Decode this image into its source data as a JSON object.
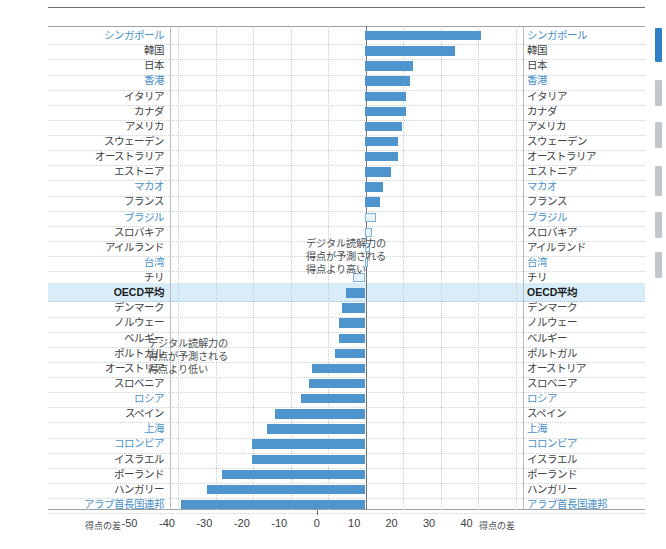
{
  "chart_data": {
    "type": "bar",
    "orientation": "horizontal",
    "title": "",
    "xlabel": "得点の差",
    "ylabel": "",
    "xlim": [
      -52,
      42
    ],
    "xticks": [
      -50,
      -40,
      -30,
      -20,
      -10,
      0,
      10,
      20,
      30,
      40
    ],
    "xtick_labels": [
      "-50",
      "-40",
      "-30",
      "-20",
      "-10",
      "0",
      "10",
      "20",
      "30",
      "40"
    ],
    "axis_caption_left": "得点の差",
    "axis_caption_right": "得点の差",
    "grid": true,
    "legend": "none",
    "annotations": [
      {
        "name": "higher-than-expected",
        "lines": [
          "デジタル読解力の",
          "得点が予測される",
          "得点より高い"
        ]
      },
      {
        "name": "lower-than-expected",
        "lines": [
          "デジタル読解力の",
          "得点が予測される",
          "得点より低い"
        ]
      }
    ],
    "categories": [
      "シンガポール",
      "韓国",
      "日本",
      "香港",
      "イタリア",
      "カナダ",
      "アメリカ",
      "スウェーデン",
      "オーストラリア",
      "エストニア",
      "マカオ",
      "フランス",
      "ブラジル",
      "スロバキア",
      "アイルランド",
      "台湾",
      "チリ",
      "OECD平均",
      "デンマーク",
      "ノルウェー",
      "ベルギー",
      "ポルトガル",
      "オーストリア",
      "スロベニア",
      "ロシア",
      "スペイン",
      "上海",
      "コロンビア",
      "イスラエル",
      "ポーランド",
      "ハンガリー",
      "アラブ首長国連邦"
    ],
    "values": [
      31,
      24,
      13,
      12,
      11,
      11,
      10,
      9,
      9,
      7,
      5,
      4,
      3,
      2,
      1.5,
      1,
      -3,
      -5,
      -6,
      -7,
      -7,
      -8,
      -14,
      -15,
      -17,
      -24,
      -26,
      -30,
      -30,
      -38,
      -42,
      -49
    ],
    "highlighted_categories": [
      "シンガポール",
      "香港",
      "マカオ",
      "ブラジル",
      "台湾",
      "ロシア",
      "上海",
      "コロンビア",
      "アラブ首長国連邦"
    ],
    "emphasized_category": "OECD平均",
    "colors": {
      "bar": "#4e95cd",
      "bar_small_fill": "#e9f3fa",
      "bar_small_border": "#7fb4db",
      "highlight_label": "#4a90c8",
      "highlight_row": "#d8edf7",
      "axis": "#6e7376",
      "grid": "#c9ced2"
    }
  },
  "minimap": {
    "markers": [
      {
        "name": "current",
        "top": 28,
        "height": 34,
        "current": true
      },
      {
        "name": "marker-1",
        "top": 80,
        "height": 26,
        "current": false
      },
      {
        "name": "marker-2",
        "top": 122,
        "height": 26,
        "current": false
      },
      {
        "name": "marker-3",
        "top": 166,
        "height": 30,
        "current": false
      },
      {
        "name": "marker-4",
        "top": 212,
        "height": 26,
        "current": false
      },
      {
        "name": "marker-5",
        "top": 252,
        "height": 26,
        "current": false
      }
    ]
  }
}
